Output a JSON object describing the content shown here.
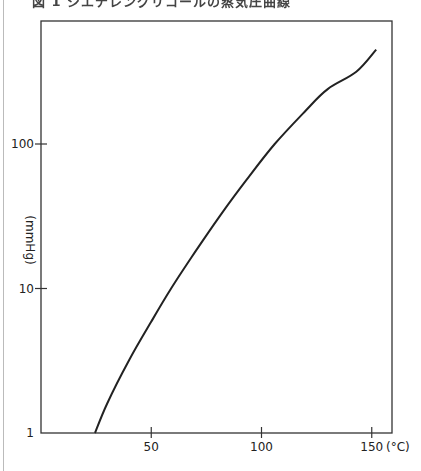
{
  "title": "図 1  ジエチレングリコールの蒸気圧曲線",
  "chart_data": {
    "type": "line",
    "xlabel": "(°C)",
    "ylabel": "(mmHg)",
    "yscale": "log",
    "xlim": [
      0,
      160
    ],
    "ylim": [
      1,
      730
    ],
    "x_ticks": [
      50,
      100,
      150
    ],
    "x_tick_labels": [
      "50",
      "100",
      "150"
    ],
    "y_ticks": [
      1,
      10,
      100
    ],
    "y_tick_labels": [
      "1",
      "10",
      "100"
    ],
    "grid": false,
    "legend": null,
    "series": [
      {
        "name": "vapor pressure",
        "x": [
          24.5,
          30,
          40,
          50,
          59,
          70,
          81,
          93,
          106,
          120,
          130,
          143,
          152
        ],
        "y": [
          1,
          1.6,
          3.2,
          5.9,
          10,
          18,
          31.6,
          56,
          100,
          170,
          240,
          316,
          450
        ]
      }
    ]
  },
  "labels": {
    "y_unit": "(mmHg)",
    "x_unit": "(°C)"
  }
}
